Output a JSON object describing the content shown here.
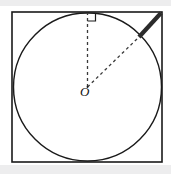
{
  "figure": {
    "background_color": "#ffffff",
    "band_color": "#ededee",
    "stroke_color": "#1a1a1a",
    "bold_stroke_color": "#2b2b2b",
    "dashed_stroke_color": "#3a3a3a",
    "center_label": "O",
    "square": {
      "name": "outer-square",
      "x": 12,
      "y": 12,
      "width": 150,
      "height": 150,
      "stroke_width": 1.6
    },
    "circle": {
      "name": "inscribed-circle",
      "cx": 87.5,
      "cy": 87,
      "r": 74,
      "stroke_width": 1.4
    },
    "center_point": {
      "x": 87.5,
      "y": 87
    },
    "radius_vertical": {
      "name": "vertical-radius",
      "x1": 87.5,
      "y1": 87,
      "x2": 87.5,
      "y2": 13,
      "dash": "3,3",
      "stroke_width": 1.3
    },
    "radius_diagonal": {
      "name": "diagonal-radius",
      "x1": 87.5,
      "y1": 87,
      "x2": 140,
      "y2": 36,
      "dash": "3,3",
      "stroke_width": 1.3
    },
    "bold_segment": {
      "name": "tangent-chord-segment",
      "x1": 161,
      "y1": 13,
      "x2": 139,
      "y2": 37,
      "stroke_width": 4.2
    },
    "right_angle_marker": {
      "name": "right-angle-marker",
      "x": 87.5,
      "y": 13,
      "size": 8,
      "stroke_width": 1.2,
      "orientation": "below-right"
    }
  }
}
